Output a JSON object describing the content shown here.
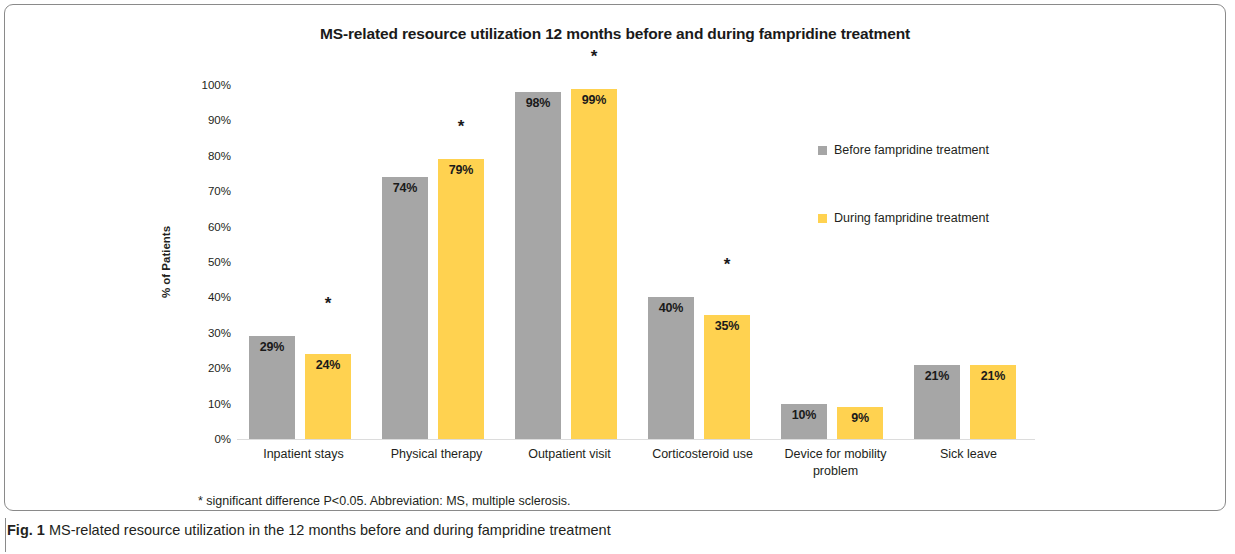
{
  "chart_data": {
    "type": "bar",
    "title": "MS-related resource utilization 12 months before and during fampridine treatment",
    "xlabel": "",
    "ylabel": "% of Patients",
    "ylim": [
      0,
      100
    ],
    "ytick_labels": [
      "100%",
      "90%",
      "80%",
      "70%",
      "60%",
      "50%",
      "40%",
      "30%",
      "20%",
      "10%",
      "0%"
    ],
    "ytick_values": [
      100,
      90,
      80,
      70,
      60,
      50,
      40,
      30,
      20,
      10,
      0
    ],
    "grid": false,
    "legend_position": "right",
    "categories": [
      "Inpatient stays",
      "Physical therapy",
      "Outpatient visit",
      "Corticosteroid use",
      "Device for mobility problem",
      "Sick leave"
    ],
    "series": [
      {
        "name": "Before fampridine treatment",
        "color": "#a6a6a6",
        "values": [
          29,
          74,
          98,
          40,
          10,
          21
        ],
        "labels": [
          "29%",
          "74%",
          "98%",
          "40%",
          "10%",
          "21%"
        ]
      },
      {
        "name": "During fampridine treatment",
        "color": "#ffd250",
        "values": [
          24,
          79,
          99,
          35,
          9,
          21
        ],
        "labels": [
          "24%",
          "79%",
          "99%",
          "35%",
          "9%",
          "21%"
        ]
      }
    ],
    "significance_markers": [
      {
        "category": "Inpatient stays",
        "symbol": "*"
      },
      {
        "category": "Physical therapy",
        "symbol": "*"
      },
      {
        "category": "Outpatient visit",
        "symbol": "*"
      },
      {
        "category": "Corticosteroid use",
        "symbol": "*"
      }
    ],
    "annotations": [
      "* significant difference P<0.05. Abbreviation: MS, multiple sclerosis."
    ]
  },
  "footnote": "* significant difference P<0.05. Abbreviation: MS, multiple sclerosis.",
  "caption": {
    "label": "Fig. 1",
    "text": "MS-related resource utilization in the 12 months before and during fampridine treatment"
  }
}
